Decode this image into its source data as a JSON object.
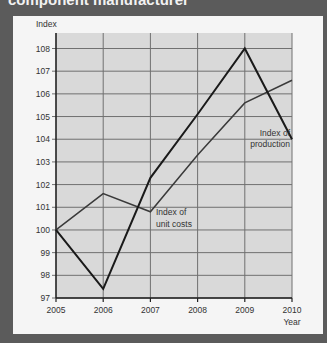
{
  "title": "component manufacturer",
  "chart_data": {
    "type": "line",
    "title": "component manufacturer",
    "xlabel": "Year",
    "ylabel": "Index",
    "x": [
      2005,
      2006,
      2007,
      2008,
      2009,
      2010
    ],
    "x_tick_labels": [
      "2005",
      "2006",
      "2007",
      "2008",
      "2009",
      "2010"
    ],
    "y_tick_labels": [
      "97",
      "98",
      "99",
      "100",
      "101",
      "102",
      "103",
      "104",
      "105",
      "106",
      "107",
      "108"
    ],
    "ylim": [
      97,
      108.7
    ],
    "grid": true,
    "series": [
      {
        "name": "Index of production",
        "values": [
          100.0,
          97.4,
          102.3,
          105.1,
          108.0,
          104.0
        ],
        "color": "#1a1a1a",
        "width": 2
      },
      {
        "name": "Index of unit costs",
        "values": [
          100.0,
          101.6,
          100.8,
          103.3,
          105.6,
          106.6
        ],
        "color": "#3a3a3a",
        "width": 1.5
      }
    ],
    "annotations": [
      {
        "lines": [
          "Index of",
          "production"
        ],
        "series": "Index of production"
      },
      {
        "lines": [
          "Index of",
          "unit costs"
        ],
        "series": "Index of unit costs"
      }
    ]
  },
  "colors": {
    "background": "#5b5b5b",
    "panel": "#f5f5f5",
    "plot_area": "#d9d9d9",
    "grid": "#707070",
    "axis": "#222222"
  }
}
